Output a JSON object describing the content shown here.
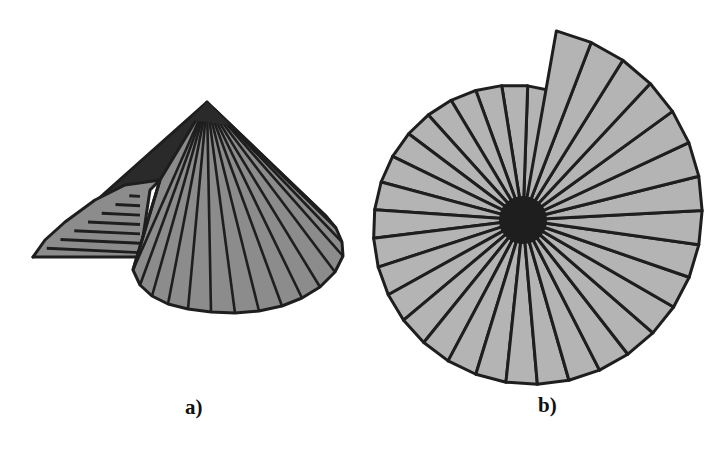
{
  "figure": {
    "panels": [
      {
        "id": "a",
        "label": "a)",
        "description": "Conical surface assembled from triangular facets with a folded flap",
        "facet_count_front": 16,
        "facet_count_flap": 7
      },
      {
        "id": "b",
        "label": "b)",
        "description": "Flattened spiral of triangular facets radiating from a common center",
        "turns": 2.2,
        "spoke_count": 72
      }
    ],
    "colors": {
      "background": "#ffffff",
      "facet_fill_a": "#8c8c8c",
      "facet_fill_b": "#b4b4b4",
      "edge": "#1e1e1e",
      "shadow": "#2a2a2a"
    }
  }
}
